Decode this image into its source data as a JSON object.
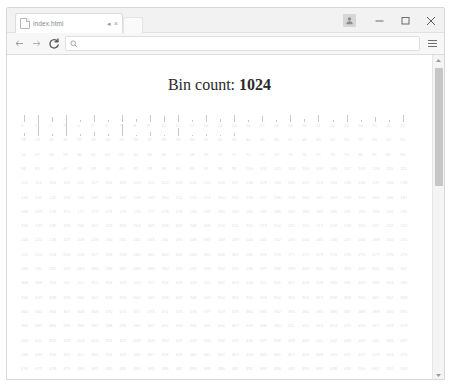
{
  "window": {
    "controls": {
      "profile_label": "profile-avatar",
      "minimize_label": "Minimize",
      "maximize_label": "Maximize",
      "close_label": "Close"
    }
  },
  "tabstrip": {
    "tabs": [
      {
        "title": "index.html",
        "favicon": "page-icon",
        "audio_glyph": "◂",
        "close_glyph": "×"
      }
    ]
  },
  "toolbar": {
    "back_label": "Back",
    "forward_label": "Forward",
    "reload_label": "Reload",
    "menu_label": "Customize and control",
    "omnibox": {
      "value": "",
      "placeholder": "",
      "icon": "search-icon"
    }
  },
  "page": {
    "heading_prefix": "Bin count:",
    "heading_value": "1024"
  },
  "scrollbar": {
    "up_glyph": "▴",
    "down_glyph": "▾"
  },
  "chart_data": {
    "type": "bar",
    "title": "Bin count: 1024",
    "xlabel": "",
    "ylabel": "",
    "bin_count": 1024,
    "grid": false,
    "legend": null,
    "note": "Each bin index 0..1023 is rendered as a thin vertical bar with its index printed beneath it; the flow wraps across the page. Only the first ~32 bins carry non-zero counts, forming a right-skewed hump; all remaining bins are zero.",
    "categories_start": 0,
    "categories_end": 1023,
    "ylim": [
      0,
      64
    ],
    "values_nonzero": {
      "0": 7,
      "1": 22,
      "2": 4,
      "3": 24,
      "4": 2,
      "5": 9,
      "6": 2,
      "7": 47,
      "8": 3,
      "9": 53,
      "10": 5,
      "11": 58,
      "12": 2,
      "13": 57,
      "14": 3,
      "15": 62,
      "16": 2,
      "17": 5,
      "18": 2,
      "19": 60,
      "20": 3,
      "21": 30,
      "22": 2,
      "23": 31,
      "24": 2,
      "25": 4,
      "26": 2,
      "27": 21,
      "28": 3,
      "29": 14,
      "30": 2,
      "31": 17,
      "32": 2,
      "33": 4,
      "34": 2,
      "35": 11,
      "36": 1,
      "37": 4,
      "38": 1,
      "39": 7,
      "40": 1,
      "41": 2,
      "42": 1,
      "43": 3
    }
  }
}
